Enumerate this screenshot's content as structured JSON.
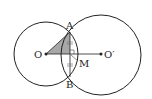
{
  "diagram": {
    "type": "intersecting-circles",
    "colors": {
      "stroke": "#222222",
      "shade": "#9a9a9a",
      "background": "#ffffff"
    },
    "circles": [
      {
        "name": "circle-O",
        "cx": 46,
        "cy": 54,
        "r": 32
      },
      {
        "name": "circle-O-prime",
        "cx": 101,
        "cy": 55,
        "r": 40
      }
    ],
    "points": {
      "O": {
        "label": "O",
        "x": 46,
        "y": 54
      },
      "O_prime": {
        "label": "O′",
        "x": 101,
        "y": 54
      },
      "A": {
        "label": "A",
        "x": 70,
        "y": 32
      },
      "B": {
        "label": "B",
        "x": 70,
        "y": 77
      },
      "M": {
        "label": "M",
        "x": 70,
        "y": 54
      }
    },
    "segments": [
      "OO′",
      "AB",
      "OA"
    ],
    "shaded_region": "triangle OAM",
    "tick_marks": "AM = MB (equal marks on AB)"
  }
}
